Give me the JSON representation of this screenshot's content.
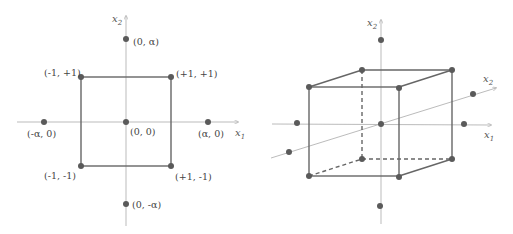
{
  "left_diagram": {
    "title": "2D central composite design",
    "axes": {
      "x_label": "x",
      "x_sub": "1",
      "y_label": "x",
      "y_sub": "2"
    },
    "points": [
      {
        "label": "(0, α)"
      },
      {
        "label": "(-1, +1)"
      },
      {
        "label": "(+1, +1)"
      },
      {
        "label": "(-α, 0)"
      },
      {
        "label": "(0, 0)"
      },
      {
        "label": "(α, 0)"
      },
      {
        "label": "(-1, -1)"
      },
      {
        "label": "(+1, -1)"
      },
      {
        "label": "(0, -α)"
      }
    ]
  },
  "right_diagram": {
    "title": "3D central composite design",
    "axes": {
      "x_label": "x",
      "x_sub": "1",
      "y_label": "x",
      "y_sub": "2",
      "z_label": "x",
      "z_sub": "2"
    }
  },
  "colors": {
    "line": "#666666",
    "axis": "#aaaaaa",
    "point": "#5a5a5a",
    "text": "#444444"
  }
}
